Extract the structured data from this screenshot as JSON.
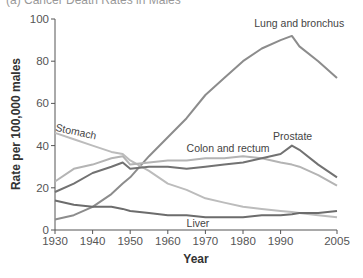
{
  "chart_data": {
    "type": "line",
    "title": "(a) Cancer Death Rates in Males",
    "xlabel": "Year",
    "ylabel": "Rate per 100,000 males",
    "xlim": [
      1930,
      2005
    ],
    "ylim": [
      0,
      100
    ],
    "x_ticks": [
      1930,
      1940,
      1950,
      1960,
      1970,
      1980,
      1990,
      2005
    ],
    "y_ticks": [
      0,
      20,
      40,
      60,
      80,
      100
    ],
    "grid": false,
    "legend": "inline labels",
    "x": [
      1930,
      1935,
      1940,
      1945,
      1948,
      1950,
      1955,
      1960,
      1965,
      1970,
      1975,
      1980,
      1985,
      1990,
      1993,
      1995,
      2000,
      2005
    ],
    "series": [
      {
        "name": "Lung and bronchus",
        "color": "#8c8c8c",
        "width": 2,
        "values": [
          5,
          7,
          11,
          17,
          22,
          25,
          35,
          44,
          53,
          64,
          72,
          80,
          86,
          90,
          92,
          87,
          80,
          72
        ],
        "label_pos": [
          1983,
          96
        ]
      },
      {
        "name": "Stomach",
        "color": "#bcbcbc",
        "width": 2,
        "values": [
          46,
          43,
          40,
          37,
          36,
          33,
          28,
          22,
          19,
          15,
          13,
          11,
          10,
          9,
          8.5,
          8,
          7,
          6
        ],
        "label_pos": [
          1930,
          47
        ],
        "label_rotate": 12
      },
      {
        "name": "Colon and rectum",
        "color": "#b4b4b4",
        "width": 2,
        "values": [
          23,
          29,
          31,
          34,
          35,
          31,
          32,
          33,
          33,
          34,
          34,
          35,
          34,
          32,
          31,
          30,
          26,
          21
        ],
        "label_pos": [
          1965,
          37
        ]
      },
      {
        "name": "Prostate",
        "color": "#727272",
        "width": 2,
        "values": [
          18,
          22,
          27,
          30,
          32,
          29,
          30,
          30,
          29,
          30,
          31,
          32,
          34,
          36,
          40,
          38,
          31,
          25
        ],
        "label_pos": [
          1988,
          42.5
        ]
      },
      {
        "name": "Liver",
        "color": "#6c6c6c",
        "width": 2,
        "values": [
          14,
          12,
          11,
          11,
          10,
          9,
          8,
          7,
          7,
          6,
          6,
          6,
          7,
          7,
          7.5,
          8,
          8,
          9
        ],
        "label_pos": [
          1965,
          1.5
        ]
      }
    ]
  }
}
